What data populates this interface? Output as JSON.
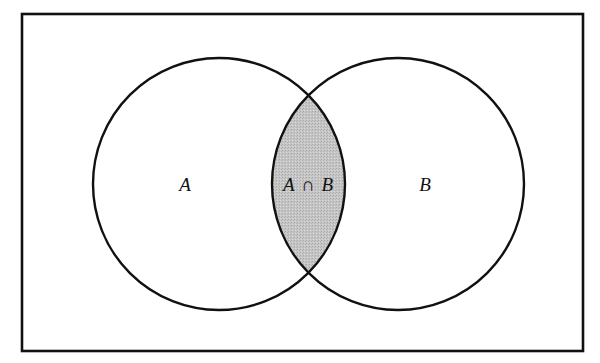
{
  "diagram": {
    "type": "venn",
    "universe": {
      "x": 22,
      "y": 14,
      "width": 561,
      "height": 337,
      "stroke": "#111111"
    },
    "sets": [
      {
        "id": "A",
        "label": "A",
        "cx": 219,
        "cy": 184,
        "r": 126
      },
      {
        "id": "B",
        "label": "B",
        "cx": 398,
        "cy": 184,
        "r": 126
      }
    ],
    "intersection": {
      "label_left": "A",
      "label_op": "∩",
      "label_right": "B",
      "fill": "#c4c4c4"
    },
    "colors": {
      "stroke": "#111111",
      "background": "#ffffff",
      "shade": "#c4c4c4"
    }
  }
}
